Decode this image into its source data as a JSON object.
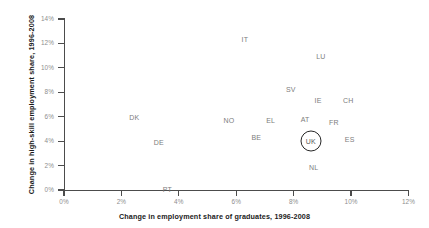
{
  "chart_data": {
    "type": "scatter",
    "title": "",
    "xlabel": "Change in employment share of graduates, 1996-2008",
    "ylabel": "Change in high-skill employment share, 1996-2008",
    "xlim": [
      0,
      12
    ],
    "ylim": [
      0,
      14
    ],
    "xticks": [
      "0%",
      "2%",
      "4%",
      "6%",
      "8%",
      "10%",
      "12%"
    ],
    "yticks": [
      "0%",
      "2%",
      "4%",
      "6%",
      "8%",
      "10%",
      "12%",
      "14%"
    ],
    "xtick_values": [
      0,
      2,
      4,
      6,
      8,
      10,
      12
    ],
    "ytick_values": [
      0,
      2,
      4,
      6,
      8,
      10,
      12,
      14
    ],
    "grid": false,
    "legend": "none",
    "marker_style": "text-label",
    "highlighted_point": "UK",
    "highlight_color": "#262626",
    "label_color": "#7d7d7d",
    "axis_color": "#4c4c4c",
    "points": [
      {
        "label": "IT",
        "x": 6.3,
        "y": 12.4
      },
      {
        "label": "LU",
        "x": 8.95,
        "y": 11.0
      },
      {
        "label": "SV",
        "x": 7.9,
        "y": 8.3
      },
      {
        "label": "IE",
        "x": 8.85,
        "y": 7.4
      },
      {
        "label": "CH",
        "x": 9.9,
        "y": 7.4
      },
      {
        "label": "DK",
        "x": 2.45,
        "y": 6.0
      },
      {
        "label": "NO",
        "x": 5.75,
        "y": 5.75
      },
      {
        "label": "EL",
        "x": 7.2,
        "y": 5.7
      },
      {
        "label": "AT",
        "x": 8.4,
        "y": 5.8
      },
      {
        "label": "FR",
        "x": 9.4,
        "y": 5.6
      },
      {
        "label": "BE",
        "x": 6.7,
        "y": 4.3
      },
      {
        "label": "UK",
        "x": 8.6,
        "y": 4.0
      },
      {
        "label": "ES",
        "x": 9.95,
        "y": 4.2
      },
      {
        "label": "DE",
        "x": 3.3,
        "y": 3.9
      },
      {
        "label": "NL",
        "x": 8.7,
        "y": 1.9
      },
      {
        "label": "PT",
        "x": 3.6,
        "y": 0.05
      }
    ]
  }
}
